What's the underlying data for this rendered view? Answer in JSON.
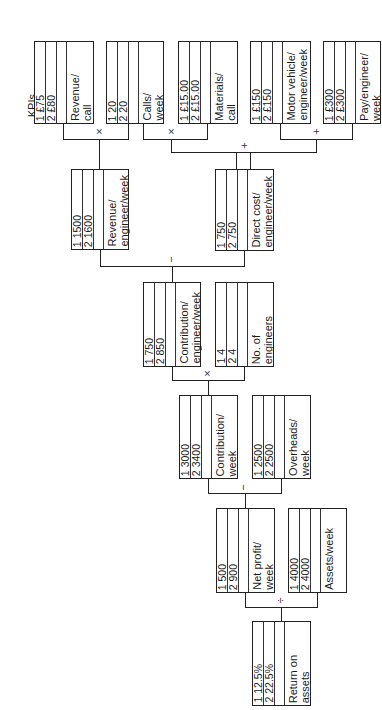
{
  "diagram": {
    "heading": "KPIs",
    "orientation": "rotated 90° counter-clockwise",
    "boxes": {
      "revenue_per_call": {
        "label": "Revenue/\ncall",
        "v1": "1  £75",
        "v2": "2  £80"
      },
      "calls_per_week": {
        "label": "Calls/\nweek",
        "v1": "1  20",
        "v2": "2  20"
      },
      "materials_per_call": {
        "label": "Materials/\ncall",
        "v1": "1  £15.00",
        "v2": "2  £15.00"
      },
      "motor_vehicle": {
        "label": "Motor vehicle/\nengineer/week",
        "v1": "1  £150",
        "v2": "2  £150"
      },
      "pay_per_engineer": {
        "label": "Pay/engineer/\nweek",
        "v1": "1  £300",
        "v2": "2  £300"
      },
      "revenue_per_engineer": {
        "label": "Revenue/\nengineer/week",
        "v1": "1  1500",
        "v2": "2  1600"
      },
      "direct_cost": {
        "label": "Direct cost/\nengineer/week",
        "v1": "1  750",
        "v2": "2  750"
      },
      "contribution_per_engineer": {
        "label": "Contribution/\nengineer/week",
        "v1": "1  750",
        "v2": "2  850"
      },
      "num_engineers": {
        "label": "No. of\nengineers",
        "v1": "1  4",
        "v2": "2  4"
      },
      "contribution_per_week": {
        "label": "Contribution/\nweek",
        "v1": "1  3000",
        "v2": "2  3400"
      },
      "overheads": {
        "label": "Overheads/\nweek",
        "v1": "1  2500",
        "v2": "2  2500"
      },
      "net_profit": {
        "label": "Net profit/\nweek",
        "v1": "1  500",
        "v2": "2  900"
      },
      "assets": {
        "label": "Assets/week",
        "v1": "1  4000",
        "v2": "2  4000"
      },
      "return_on_assets": {
        "label": "Return on\nassets",
        "v1": "1  12.5%",
        "v2": "2  22.5%"
      }
    },
    "operators": {
      "rev_x_calls": "×",
      "calls_x_materials": "×",
      "motor_plus_pay": "+",
      "materials_plus_fixed": "+",
      "revenue_minus_direct": "−",
      "contribution_x_engineers": "×",
      "contribution_minus_overheads": "−",
      "profit_div_assets": "÷"
    }
  }
}
